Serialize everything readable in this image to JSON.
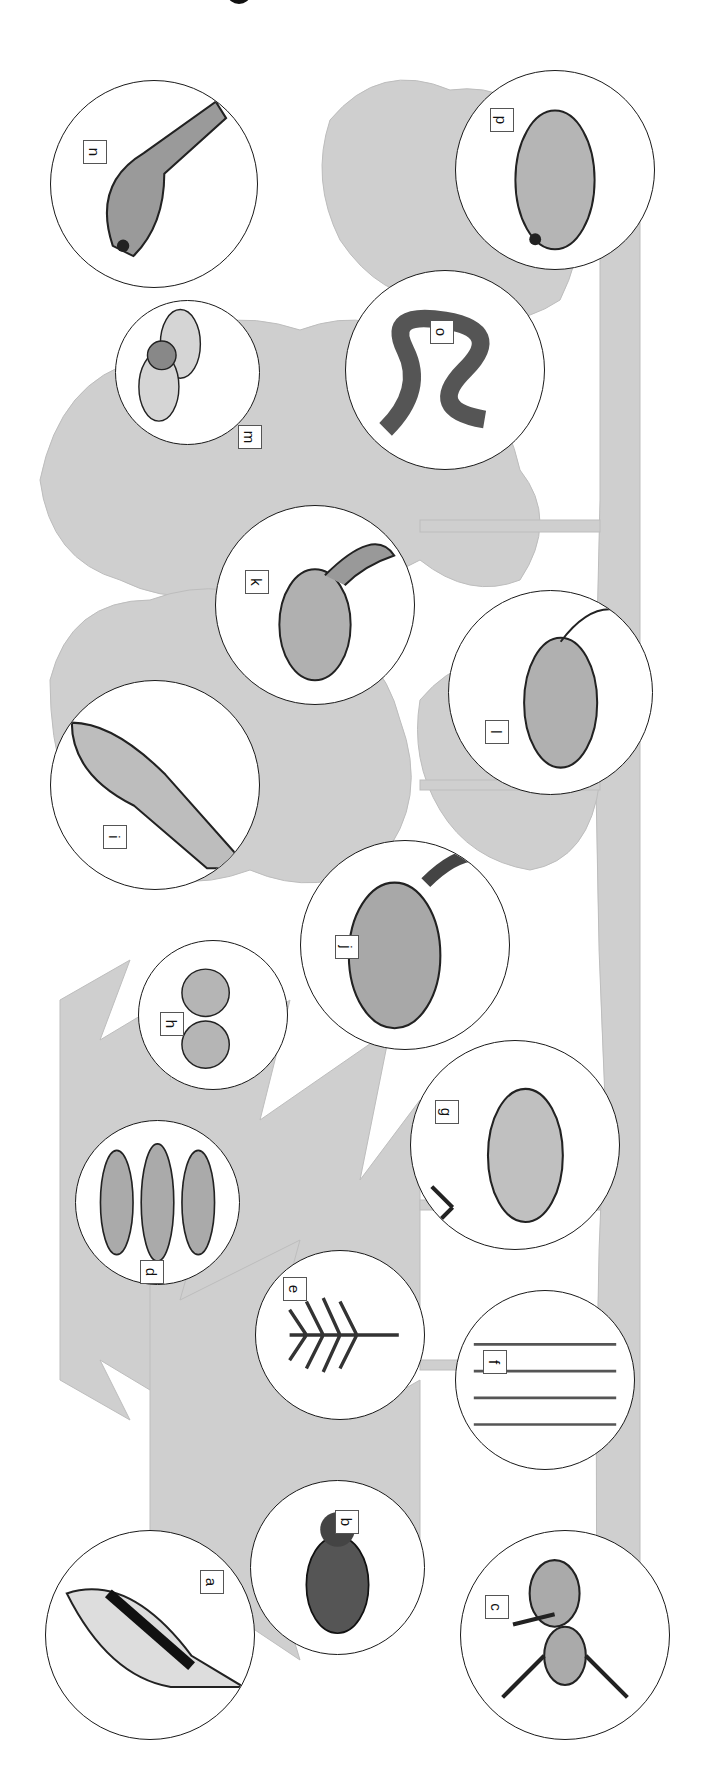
{
  "figure": {
    "orientation": "rotated 90 degrees clockwise",
    "background_color": "#ffffff",
    "forest_color": "#c8c8c8",
    "circle_stroke": "#1a1a1a",
    "organisms": [
      {
        "label": "a",
        "subject": "great spotted woodpecker"
      },
      {
        "label": "b",
        "subject": "bark beetle"
      },
      {
        "label": "c",
        "subject": "ant"
      },
      {
        "label": "d",
        "subject": "spruce cones"
      },
      {
        "label": "e",
        "subject": "spruce twig"
      },
      {
        "label": "f",
        "subject": "grasses"
      },
      {
        "label": "g",
        "subject": "roe deer"
      },
      {
        "label": "h",
        "subject": "hazelnuts"
      },
      {
        "label": "i",
        "subject": "sparrowhawk"
      },
      {
        "label": "j",
        "subject": "fox"
      },
      {
        "label": "k",
        "subject": "squirrel"
      },
      {
        "label": "l",
        "subject": "mouse"
      },
      {
        "label": "m",
        "subject": "acorns"
      },
      {
        "label": "n",
        "subject": "songbird"
      },
      {
        "label": "o",
        "subject": "adder snake"
      },
      {
        "label": "p",
        "subject": "frog"
      }
    ]
  }
}
